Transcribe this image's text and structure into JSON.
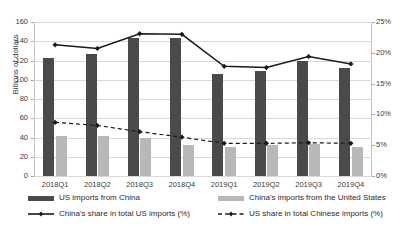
{
  "chart_data": {
    "type": "bar",
    "title": "",
    "subtitle": "",
    "xlabel": "",
    "ylabel": "Billions of dollars",
    "y2label": "",
    "categories": [
      "2018Q1",
      "2018Q2",
      "2018Q3",
      "2018Q4",
      "2019Q1",
      "2019Q2",
      "2019Q3",
      "2019Q4"
    ],
    "ylim": [
      0,
      160
    ],
    "y2lim": [
      0,
      25
    ],
    "yticks": [
      "0",
      "20",
      "40",
      "60",
      "80",
      "100",
      "120",
      "140",
      "160"
    ],
    "ytick_values": [
      0,
      20,
      40,
      60,
      80,
      100,
      120,
      140,
      160
    ],
    "y2ticks": [
      "0%",
      "5%",
      "10%",
      "15%",
      "20%",
      "25%"
    ],
    "y2tick_values": [
      0,
      5,
      10,
      15,
      20,
      25
    ],
    "grid": true,
    "legend_position": "bottom",
    "series": [
      {
        "name": "US imports from China",
        "type": "bar",
        "axis": "left",
        "color": "#4a4a4a",
        "values": [
          123,
          127,
          143,
          143,
          106,
          109,
          120,
          112
        ]
      },
      {
        "name": "China's imports from the United States",
        "type": "bar",
        "axis": "left",
        "color": "#b8b8b8",
        "values": [
          41.5,
          41.5,
          40,
          32,
          30,
          32,
          33,
          30
        ]
      },
      {
        "name": "China's share in total US imports (%)",
        "type": "line",
        "axis": "right",
        "color": "#1a1a1a",
        "style": "solid",
        "values": [
          21.3,
          20.7,
          23.1,
          23.0,
          17.8,
          17.6,
          19.4,
          18.2
        ]
      },
      {
        "name": "US share in total Chinese imports (%)",
        "type": "line",
        "axis": "right",
        "color": "#1a1a1a",
        "style": "dashed",
        "values": [
          8.7,
          8.2,
          7.2,
          6.3,
          5.3,
          5.3,
          5.4,
          5.3
        ]
      }
    ]
  },
  "colors": {
    "bar_dark": "#4a4a4a",
    "bar_light": "#b8b8b8",
    "line": "#1a1a1a",
    "grid": "#d9d9d9",
    "axis": "#a6a6a6",
    "text": "#2b2b2b",
    "background": "#ffffff"
  }
}
